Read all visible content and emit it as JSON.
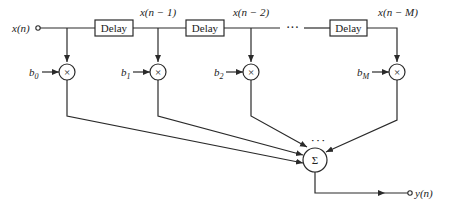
{
  "diagram": {
    "type": "FIR filter direct-form block diagram",
    "input": {
      "label": "x(n)"
    },
    "output": {
      "label": "y(n)"
    },
    "delays": [
      {
        "label": "Delay",
        "output_label": "x(n − 1)"
      },
      {
        "label": "Delay",
        "output_label": "x(n − 2)"
      },
      {
        "label": "Delay",
        "output_label": "x(n − M)"
      }
    ],
    "ellipsis": "···",
    "sum_ellipsis": "· · ·",
    "multipliers": [
      {
        "coef_base": "b",
        "coef_sub": "0",
        "symbol": "×"
      },
      {
        "coef_base": "b",
        "coef_sub": "1",
        "symbol": "×"
      },
      {
        "coef_base": "b",
        "coef_sub": "2",
        "symbol": "×"
      },
      {
        "coef_base": "b",
        "coef_sub": "M",
        "symbol": "×"
      }
    ],
    "summer": {
      "symbol": "Σ"
    }
  }
}
